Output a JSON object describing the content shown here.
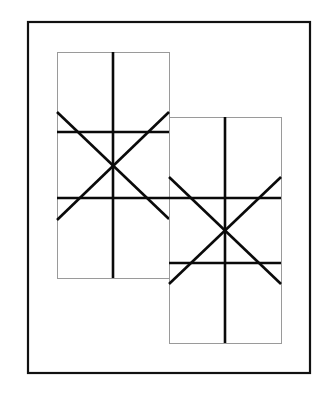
{
  "canvas": {
    "width": 319,
    "height": 415,
    "background": "#ffffff"
  },
  "colors": {
    "frame_stroke": "#111111",
    "panel_stroke": "#9a9a9a",
    "line_stroke": "#0a0a0a"
  },
  "outer_frame": {
    "x": 28,
    "y": 22,
    "width": 282,
    "height": 351,
    "stroke_width": 2.2
  },
  "panels": [
    {
      "name": "left-panel",
      "x": 57,
      "y": 52,
      "width": 112,
      "height": 226,
      "vertical_line": {
        "x": 113,
        "y1": 52,
        "y2": 278
      },
      "horizontal_lines": [
        {
          "y": 132,
          "x1": 57,
          "x2": 169
        },
        {
          "y": 198,
          "x1": 57,
          "x2": 169
        }
      ],
      "diagonals": [
        {
          "x1": 57,
          "y1": 112,
          "x2": 169,
          "y2": 219
        },
        {
          "x1": 57,
          "y1": 220,
          "x2": 169,
          "y2": 112
        }
      ],
      "center": {
        "x": 113,
        "y": 165
      }
    },
    {
      "name": "right-panel",
      "x": 169,
      "y": 117,
      "width": 112,
      "height": 226,
      "vertical_line": {
        "x": 225,
        "y1": 117,
        "y2": 343
      },
      "horizontal_lines": [
        {
          "y": 198,
          "x1": 169,
          "x2": 281
        },
        {
          "y": 263,
          "x1": 169,
          "x2": 281
        }
      ],
      "diagonals": [
        {
          "x1": 169,
          "y1": 177,
          "x2": 281,
          "y2": 284
        },
        {
          "x1": 169,
          "y1": 284,
          "x2": 281,
          "y2": 177
        }
      ],
      "center": {
        "x": 225,
        "y": 231
      }
    }
  ],
  "stroke_widths": {
    "panel": 1,
    "line": 2.6
  }
}
